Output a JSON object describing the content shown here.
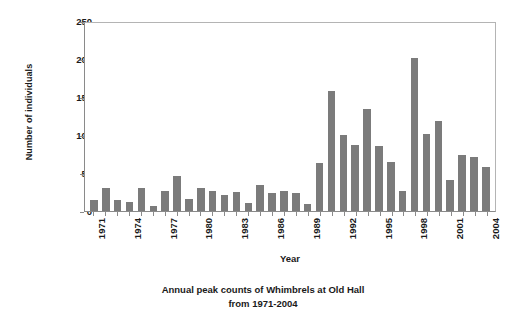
{
  "chart_data": {
    "type": "bar",
    "title": "",
    "caption_line1": "Annual peak counts of Whimbrels at Old Hall",
    "caption_line2": "from 1971-2004",
    "xlabel": "Year",
    "ylabel": "Number of individuals",
    "ylim": [
      0,
      250
    ],
    "yticks": [
      0,
      50,
      100,
      150,
      200,
      250
    ],
    "ytick_labels": [
      "0",
      "50",
      "100",
      "150",
      "200",
      "250"
    ],
    "grid": false,
    "legend": "none",
    "bar_color": "#7b7b7b",
    "axis_color": "#8a8a8a",
    "background": "#ffffff",
    "xtick_labels": [
      "1971",
      "1974",
      "1977",
      "1980",
      "1983",
      "1986",
      "1989",
      "1992",
      "1995",
      "1998",
      "2001",
      "2004"
    ],
    "categories": [
      "1971",
      "1972",
      "1973",
      "1974",
      "1975",
      "1976",
      "1977",
      "1978",
      "1979",
      "1980",
      "1981",
      "1982",
      "1983",
      "1984",
      "1985",
      "1986",
      "1987",
      "1988",
      "1989",
      "1990",
      "1991",
      "1992",
      "1993",
      "1994",
      "1995",
      "1996",
      "1997",
      "1998",
      "1999",
      "2000",
      "2001",
      "2002",
      "2003",
      "2004"
    ],
    "values": [
      15,
      30,
      15,
      12,
      30,
      7,
      27,
      46,
      16,
      31,
      27,
      21,
      25,
      11,
      34,
      24,
      27,
      24,
      9,
      64,
      159,
      101,
      88,
      136,
      87,
      65,
      26,
      203,
      102,
      120,
      41,
      75,
      72,
      58
    ]
  }
}
